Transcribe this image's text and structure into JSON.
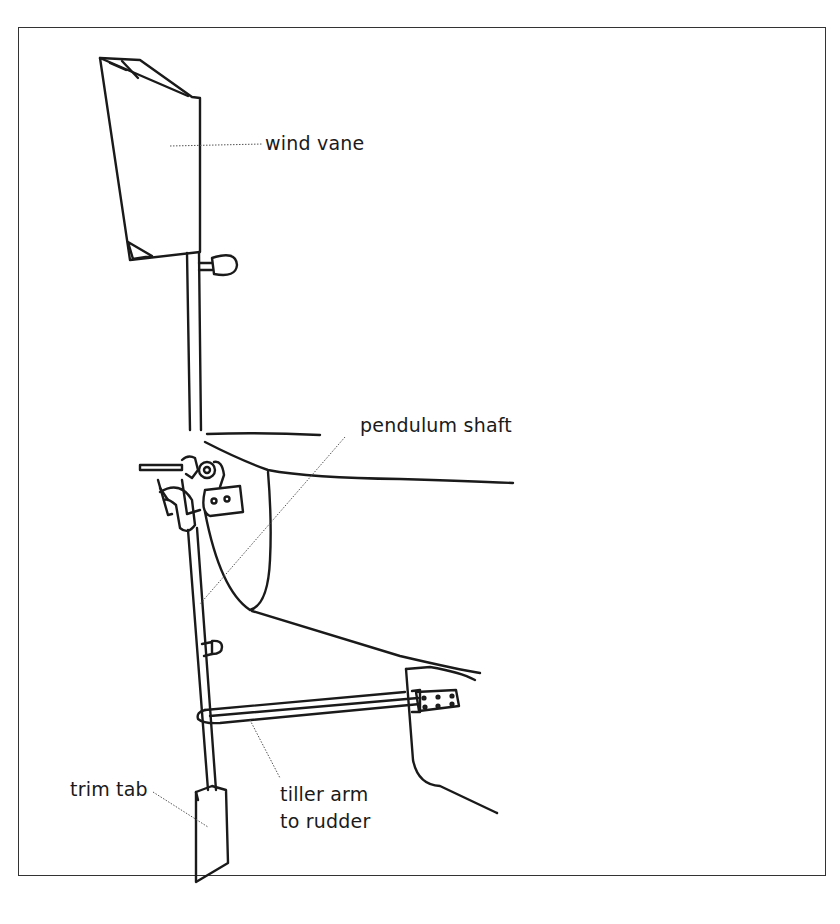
{
  "figure": {
    "labels": {
      "wind_vane": "wind vane",
      "pendulum_shaft": "pendulum shaft",
      "trim_tab": "trim tab",
      "tiller_arm_line1": "tiller arm",
      "tiller_arm_line2": "to rudder"
    }
  },
  "colors": {
    "ink": "#1a1a1a",
    "frame": "#333333",
    "leader": "#555555",
    "background": "#ffffff"
  }
}
